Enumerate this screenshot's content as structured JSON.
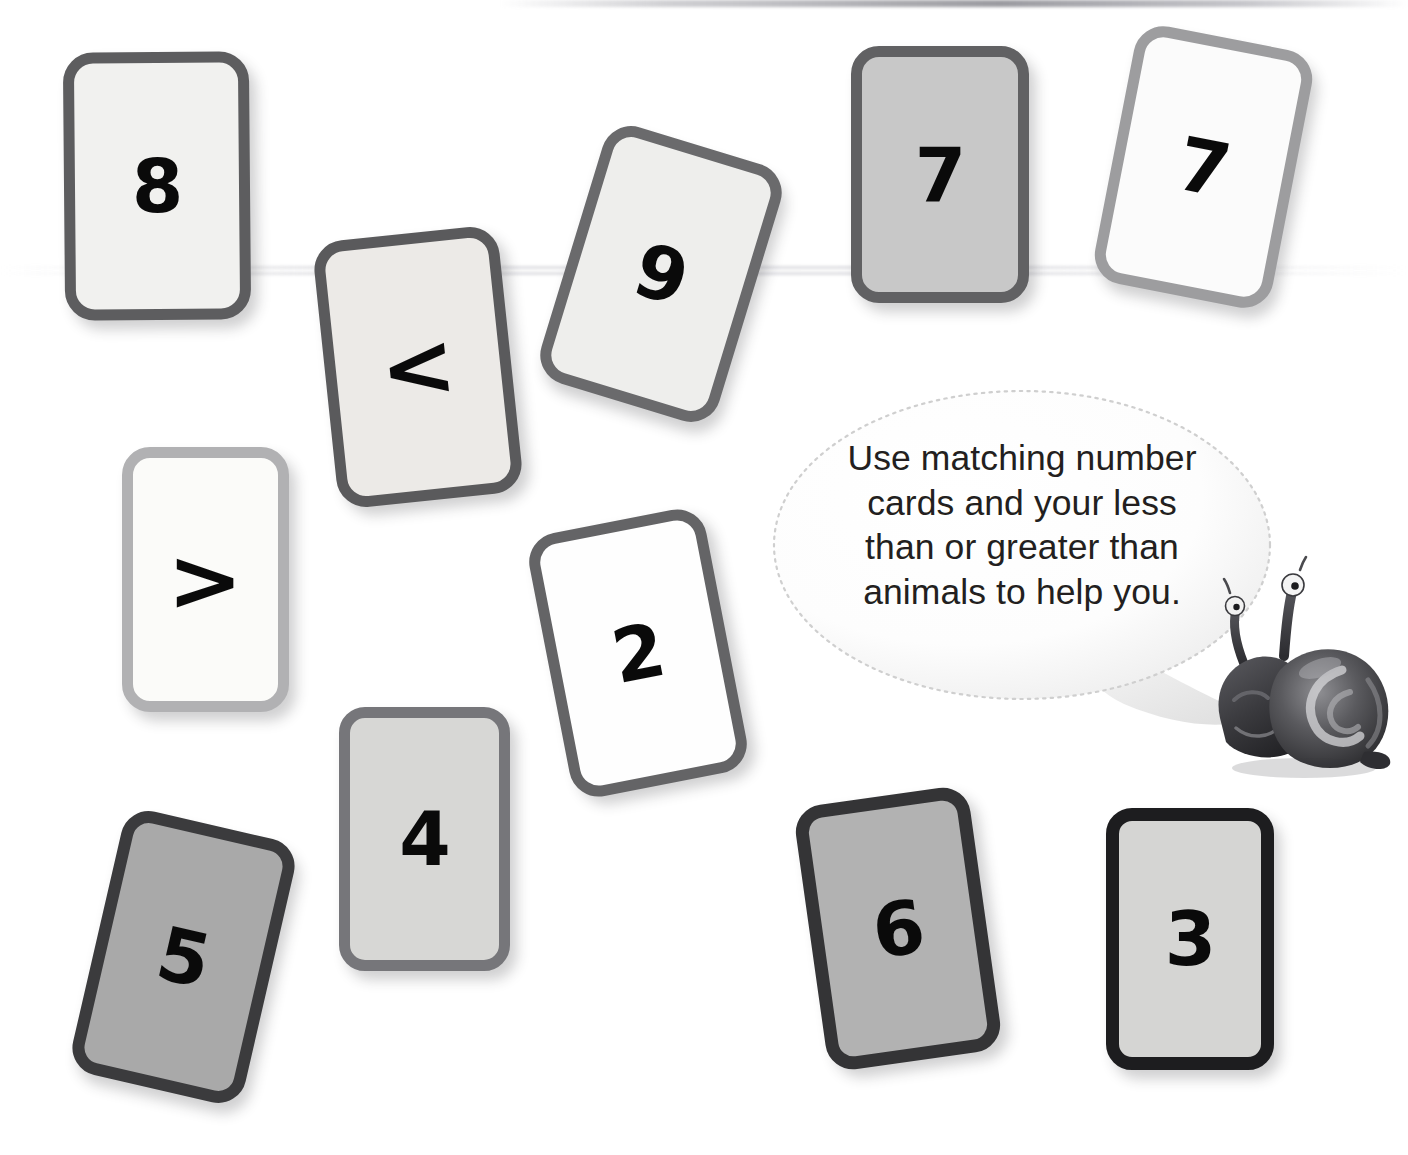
{
  "page": {
    "background_color": "#ffffff",
    "width": 1408,
    "height": 1155
  },
  "speech_bubble": {
    "name": "instruction-speech-bubble",
    "text": "Use matching number cards and your less than or greater than animals to help you.",
    "lines": [
      "Use matching number",
      "cards and your less",
      "than or greater than",
      "animals to help you."
    ],
    "text_color": "#231f20",
    "border_style": "dotted",
    "border_color": "#cfcfcf",
    "fill_color": "#ffffff"
  },
  "mascot": {
    "name": "snail-mascot",
    "label": "snail",
    "body_color": "#3a3a3c",
    "shell_color": "#4a4a4e",
    "highlight_color": "#d8d8da"
  },
  "cards": [
    {
      "id": "card-8",
      "name": "number-card-8",
      "value": "8",
      "kind": "number",
      "x": 64,
      "y": 52,
      "w": 186,
      "h": 268,
      "rotation": -0.5,
      "fill": "#f1f1ef",
      "border": "#5d5d5f",
      "border_width": 11,
      "radius": 30
    },
    {
      "id": "card-less-than",
      "name": "operator-card-less-than",
      "value": "<",
      "kind": "operator",
      "x": 325,
      "y": 233,
      "w": 186,
      "h": 268,
      "rotation": -6,
      "fill": "#eceae7",
      "border": "#5a5a5c",
      "border_width": 11,
      "radius": 30
    },
    {
      "id": "card-9",
      "name": "number-card-9",
      "value": "9",
      "kind": "number",
      "x": 568,
      "y": 140,
      "w": 186,
      "h": 268,
      "rotation": 17,
      "fill": "#eeeeec",
      "border": "#6a6a6c",
      "border_width": 11,
      "radius": 30
    },
    {
      "id": "card-7-gray",
      "name": "number-card-7-gray",
      "value": "7",
      "kind": "number",
      "x": 851,
      "y": 46,
      "w": 178,
      "h": 257,
      "rotation": 0,
      "fill": "#c8c8c8",
      "border": "#616163",
      "border_width": 11,
      "radius": 28
    },
    {
      "id": "card-7-white",
      "name": "number-card-7-white",
      "value": "7",
      "kind": "number",
      "x": 1113,
      "y": 36,
      "w": 181,
      "h": 262,
      "rotation": 11,
      "fill": "#fbfbfb",
      "border": "#9d9d9f",
      "border_width": 11,
      "radius": 30
    },
    {
      "id": "card-greater-than",
      "name": "operator-card-greater-than",
      "value": ">",
      "kind": "operator",
      "x": 122,
      "y": 447,
      "w": 167,
      "h": 265,
      "rotation": 0,
      "fill": "#fbfbf9",
      "border": "#b1b1b3",
      "border_width": 11,
      "radius": 28
    },
    {
      "id": "card-2",
      "name": "number-card-2",
      "value": "2",
      "kind": "number",
      "x": 548,
      "y": 519,
      "w": 180,
      "h": 268,
      "rotation": -11,
      "fill": "#fefefe",
      "border": "#646466",
      "border_width": 11,
      "radius": 30
    },
    {
      "id": "card-4",
      "name": "number-card-4",
      "value": "4",
      "kind": "number",
      "x": 339,
      "y": 707,
      "w": 171,
      "h": 264,
      "rotation": 0,
      "fill": "#d7d7d5",
      "border": "#76767a",
      "border_width": 11,
      "radius": 26
    },
    {
      "id": "card-5",
      "name": "number-card-5",
      "value": "5",
      "kind": "number",
      "x": 95,
      "y": 822,
      "w": 177,
      "h": 270,
      "rotation": 13,
      "fill": "#a9a9a9",
      "border": "#3b3b3d",
      "border_width": 12,
      "radius": 28
    },
    {
      "id": "card-6",
      "name": "number-card-6",
      "value": "6",
      "kind": "number",
      "x": 810,
      "y": 795,
      "w": 176,
      "h": 267,
      "rotation": -8,
      "fill": "#b2b2b2",
      "border": "#343436",
      "border_width": 13,
      "radius": 28
    },
    {
      "id": "card-3",
      "name": "number-card-3",
      "value": "3",
      "kind": "number",
      "x": 1106,
      "y": 808,
      "w": 168,
      "h": 262,
      "rotation": 0,
      "fill": "#d5d5d3",
      "border": "#1d1d1f",
      "border_width": 13,
      "radius": 26
    }
  ],
  "ghost_text": {
    "name": "page-show-through-text",
    "lines": [
      {
        "text": "Draw the",
        "x": 348,
        "y": 812,
        "size": 30
      },
      {
        "text": "from a",
        "x": 352,
        "y": 870,
        "size": 30
      },
      {
        "text": "value car",
        "x": 346,
        "y": 925,
        "size": 30
      }
    ]
  }
}
